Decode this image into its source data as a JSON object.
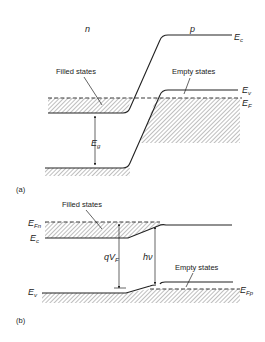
{
  "figure": {
    "panel_a": {
      "label": "(a)",
      "region_left": "n",
      "region_right": "p",
      "filled_states": "Filled states",
      "empty_states": "Empty states",
      "ec": {
        "main": "E",
        "sub": "c"
      },
      "ev": {
        "main": "E",
        "sub": "v"
      },
      "ef": {
        "main": "E",
        "sub": "F"
      },
      "eg": {
        "main": "E",
        "sub": "g"
      }
    },
    "panel_b": {
      "label": "(b)",
      "filled_states": "Filled states",
      "empty_states": "Empty states",
      "efn": {
        "main": "E",
        "sub": "Fn"
      },
      "ec": {
        "main": "E",
        "sub": "c"
      },
      "ev": {
        "main": "E",
        "sub": "v"
      },
      "efp": {
        "main": "E",
        "sub": "Fp"
      },
      "qvf": {
        "main": "qV",
        "sub": "F"
      },
      "hv": "hν"
    }
  },
  "colors": {
    "line": "#222222",
    "background": "#ffffff"
  }
}
